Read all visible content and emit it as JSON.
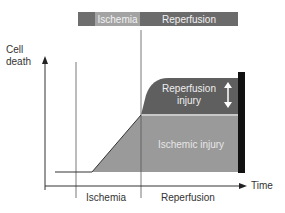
{
  "phase_bar": {
    "segments": [
      {
        "label": "",
        "color": "#6e6e6e"
      },
      {
        "label": "Ischemia",
        "color": "#a3a3a3"
      },
      {
        "label": "Reperfusion",
        "color": "#6b6b6b"
      }
    ]
  },
  "axes": {
    "y_label_line1": "Cell",
    "y_label_line2": "death",
    "x_label": "Time"
  },
  "phases_bottom": {
    "ischemia": "Ischemia",
    "reperfusion": "Reperfusion"
  },
  "regions": {
    "reperfusion_injury_line1": "Reperfusion",
    "reperfusion_injury_line2": "injury",
    "ischemic_injury": "Ischemic injury"
  },
  "colors": {
    "reperfusion_injury": "#5f5f5f",
    "ischemic_injury": "#9a9a9a",
    "separator": "#c8c8c8",
    "black_bar": "#111111"
  }
}
